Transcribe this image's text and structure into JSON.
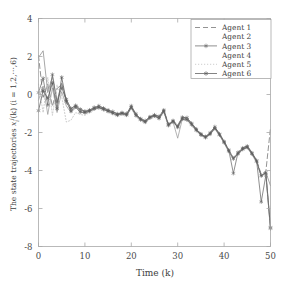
{
  "chart_data": {
    "type": "line",
    "title": "",
    "xlabel": "Time (k)",
    "ylabel": "The state trajectories x_i^j(k) (i = 1,2,...,6)",
    "xlim": [
      0,
      50
    ],
    "ylim": [
      -8,
      4
    ],
    "xticks": [
      0,
      10,
      20,
      30,
      40,
      50
    ],
    "yticks": [
      4,
      2,
      0,
      -2,
      -4,
      -6,
      -8
    ],
    "xtick_labels": [
      "0",
      "10",
      "20",
      "30",
      "40",
      "50"
    ],
    "ytick_labels": [
      "4",
      "2",
      "0",
      "-2",
      "-4",
      "-6",
      "-8"
    ],
    "grid": false,
    "legend_position": "top-right",
    "x": [
      0,
      1,
      2,
      3,
      4,
      5,
      6,
      7,
      8,
      9,
      10,
      11,
      12,
      13,
      14,
      15,
      16,
      17,
      18,
      19,
      20,
      21,
      22,
      23,
      24,
      25,
      26,
      27,
      28,
      29,
      30,
      31,
      32,
      33,
      34,
      35,
      36,
      37,
      38,
      39,
      40,
      41,
      42,
      43,
      44,
      45,
      46,
      47,
      48,
      49,
      50
    ],
    "series": [
      {
        "name": "Agent 1",
        "style": "dashed",
        "marker": "none",
        "color": "#6f6f6f",
        "values": [
          2.05,
          -0.15,
          0.55,
          -0.62,
          0.3,
          0.55,
          -0.45,
          -0.8,
          -0.55,
          -0.7,
          -0.95,
          -0.8,
          -0.72,
          -0.62,
          -0.7,
          -0.8,
          -0.95,
          -1.05,
          -0.95,
          -1.05,
          -0.62,
          -1.05,
          -1.3,
          -1.42,
          -1.2,
          -1.05,
          -1.18,
          -0.8,
          -1.55,
          -1.35,
          -1.62,
          -1.18,
          -1.25,
          -1.5,
          -1.8,
          -2.05,
          -2.25,
          -2.0,
          -1.72,
          -2.05,
          -2.45,
          -2.9,
          -3.35,
          -3.05,
          -2.8,
          -2.7,
          -3.05,
          -3.45,
          -4.2,
          -4.05,
          -1.75
        ]
      },
      {
        "name": "Agent 2",
        "style": "solid",
        "marker": "none",
        "color": "#8a8a8a",
        "values": [
          1.95,
          2.3,
          0.1,
          0.95,
          -0.35,
          0.6,
          -0.3,
          -0.72,
          -0.6,
          -0.82,
          -0.9,
          -0.85,
          -0.7,
          -0.66,
          -0.75,
          -0.85,
          -0.92,
          -1.0,
          -0.98,
          -1.02,
          -0.66,
          -1.08,
          -1.25,
          -1.4,
          -1.15,
          -1.1,
          -1.22,
          -0.85,
          -1.6,
          -1.4,
          -1.7,
          -1.22,
          -1.28,
          -1.55,
          -1.85,
          -2.1,
          -2.2,
          -2.05,
          -1.75,
          -2.1,
          -2.5,
          -2.95,
          -3.3,
          -3.1,
          -2.85,
          -2.75,
          -3.1,
          -3.5,
          -4.25,
          -4.1,
          -4.8
        ]
      },
      {
        "name": "Agent 3",
        "style": "solid",
        "marker": "star",
        "color": "#6a6a6a",
        "values": [
          0.1,
          0.85,
          -0.55,
          1.05,
          -0.4,
          0.35,
          -0.25,
          -0.75,
          -0.58,
          -0.78,
          -0.88,
          -0.82,
          -0.68,
          -0.6,
          -0.72,
          -0.82,
          -0.9,
          -1.02,
          -0.96,
          -1.0,
          -0.6,
          -1.02,
          -1.28,
          -1.38,
          -1.18,
          -1.08,
          -1.15,
          -0.82,
          -1.58,
          -1.38,
          -1.68,
          -1.2,
          -1.22,
          -1.52,
          -1.82,
          -2.08,
          -2.22,
          -2.02,
          -1.7,
          -2.08,
          -2.48,
          -2.92,
          -4.15,
          -3.05,
          -2.82,
          -2.72,
          -3.08,
          -3.48,
          -5.65,
          -4.25,
          -7.05
        ]
      },
      {
        "name": "Agent 4",
        "style": "solid",
        "marker": "none",
        "color": "#9a9a9a",
        "values": [
          -0.3,
          0.45,
          -1.05,
          0.35,
          -0.95,
          0.15,
          -0.6,
          -0.95,
          -0.7,
          -0.88,
          -1.0,
          -0.9,
          -0.78,
          -0.7,
          -0.8,
          -0.9,
          -1.0,
          -1.1,
          -1.02,
          -1.1,
          -0.7,
          -1.12,
          -1.35,
          -1.48,
          -1.25,
          -1.15,
          -1.28,
          -0.9,
          -1.65,
          -1.45,
          -2.3,
          -1.3,
          -1.35,
          -1.6,
          -1.9,
          -2.15,
          -2.28,
          -2.1,
          -1.8,
          -2.15,
          -2.55,
          -3.0,
          -3.4,
          -3.15,
          -2.9,
          -2.8,
          -3.15,
          -3.55,
          -4.3,
          -4.15,
          -7.15
        ]
      },
      {
        "name": "Agent 5",
        "style": "dotted",
        "marker": "none",
        "color": "#bdbdbd",
        "values": [
          0.55,
          -0.95,
          0.9,
          -1.1,
          0.5,
          -0.1,
          -1.45,
          -1.35,
          -0.95,
          -1.05,
          -1.1,
          -0.95,
          -0.82,
          -0.75,
          -0.85,
          -0.95,
          -1.05,
          -1.15,
          -1.08,
          -1.15,
          -0.75,
          -1.18,
          -1.4,
          -1.52,
          -1.3,
          -1.2,
          -1.32,
          -0.95,
          -1.7,
          -1.5,
          -1.75,
          -1.35,
          -1.4,
          -1.65,
          -1.95,
          -2.18,
          -2.3,
          -2.12,
          -1.82,
          -2.18,
          -2.58,
          -3.02,
          -3.42,
          -3.18,
          -2.92,
          -2.82,
          -3.18,
          -3.58,
          -4.32,
          -4.18,
          -6.9
        ]
      },
      {
        "name": "Agent 6",
        "style": "solid",
        "marker": "star",
        "color": "#5a5a5a",
        "values": [
          -0.85,
          0.2,
          -0.2,
          0.6,
          -0.75,
          0.9,
          -0.35,
          -0.88,
          -0.65,
          -0.92,
          -0.95,
          -0.88,
          -0.75,
          -0.68,
          -0.78,
          -0.88,
          -0.98,
          -1.08,
          -1.0,
          -1.08,
          -0.68,
          -1.1,
          -1.32,
          -1.45,
          -1.22,
          -1.12,
          -1.25,
          -0.88,
          -1.62,
          -1.42,
          -1.72,
          -1.28,
          -1.32,
          -1.58,
          -1.88,
          -2.12,
          -2.26,
          -2.08,
          -1.78,
          -2.12,
          -2.52,
          -2.98,
          -3.38,
          -3.12,
          -2.88,
          -2.78,
          -3.12,
          -3.52,
          -4.28,
          -4.12,
          -7.0
        ]
      }
    ]
  },
  "legend": {
    "entries": [
      {
        "label": "Agent 1"
      },
      {
        "label": "Agent 2"
      },
      {
        "label": "Agent 3"
      },
      {
        "label": "Agent 4"
      },
      {
        "label": "Agent 5"
      },
      {
        "label": "Agent 6"
      }
    ]
  },
  "axis": {
    "xlabel": "Time (k)",
    "ylabel_parts": {
      "lead": "The state trajectories ",
      "var": "x",
      "sub": "i",
      "sup": "j",
      "arg": "(k) (i",
      "eq": " = 1,2,",
      "dots": "···",
      "tail": ",6)"
    }
  }
}
